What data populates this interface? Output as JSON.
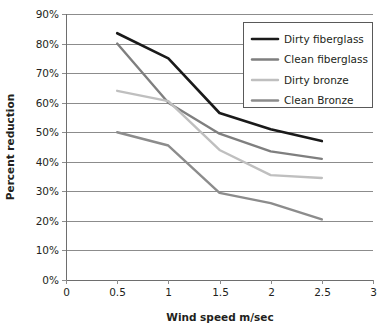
{
  "chart_data": {
    "type": "line",
    "title": "",
    "xlabel": "Wind speed m/sec",
    "ylabel": "Percent reduction",
    "xlim": [
      0,
      3
    ],
    "ylim": [
      0,
      90
    ],
    "grid": "horizontal",
    "legend_position": "top-right",
    "x_ticks": [
      "0",
      "0.5",
      "1",
      "1.5",
      "2",
      "2.5",
      "3"
    ],
    "x_tick_values": [
      0,
      0.5,
      1,
      1.5,
      2,
      2.5,
      3
    ],
    "y_ticks": [
      "0%",
      "10%",
      "20%",
      "30%",
      "40%",
      "50%",
      "60%",
      "70%",
      "80%",
      "90%"
    ],
    "y_tick_values": [
      0,
      10,
      20,
      30,
      40,
      50,
      60,
      70,
      80,
      90
    ],
    "x": [
      0.5,
      1,
      1.5,
      2,
      2.5
    ],
    "series": [
      {
        "name": "Dirty fiberglass",
        "color": "#1a1a1a",
        "width": 2.6,
        "values": [
          83.5,
          75,
          56.5,
          51,
          47
        ]
      },
      {
        "name": "Clean fiberglass",
        "color": "#7f7f7f",
        "width": 2.4,
        "values": [
          80,
          60,
          49.5,
          43.5,
          41
        ]
      },
      {
        "name": "Dirty bronze",
        "color": "#bfbfbf",
        "width": 2.4,
        "values": [
          64,
          60.5,
          44,
          35.5,
          34.5
        ]
      },
      {
        "name": "Clean Bronze",
        "color": "#8c8c8c",
        "width": 2.4,
        "values": [
          50,
          45.5,
          29.5,
          26,
          20.5
        ]
      }
    ]
  },
  "legend": {
    "entries": [
      {
        "label": "Dirty fiberglass"
      },
      {
        "label": "Clean fiberglass"
      },
      {
        "label": "Dirty bronze"
      },
      {
        "label": "Clean Bronze"
      }
    ]
  }
}
